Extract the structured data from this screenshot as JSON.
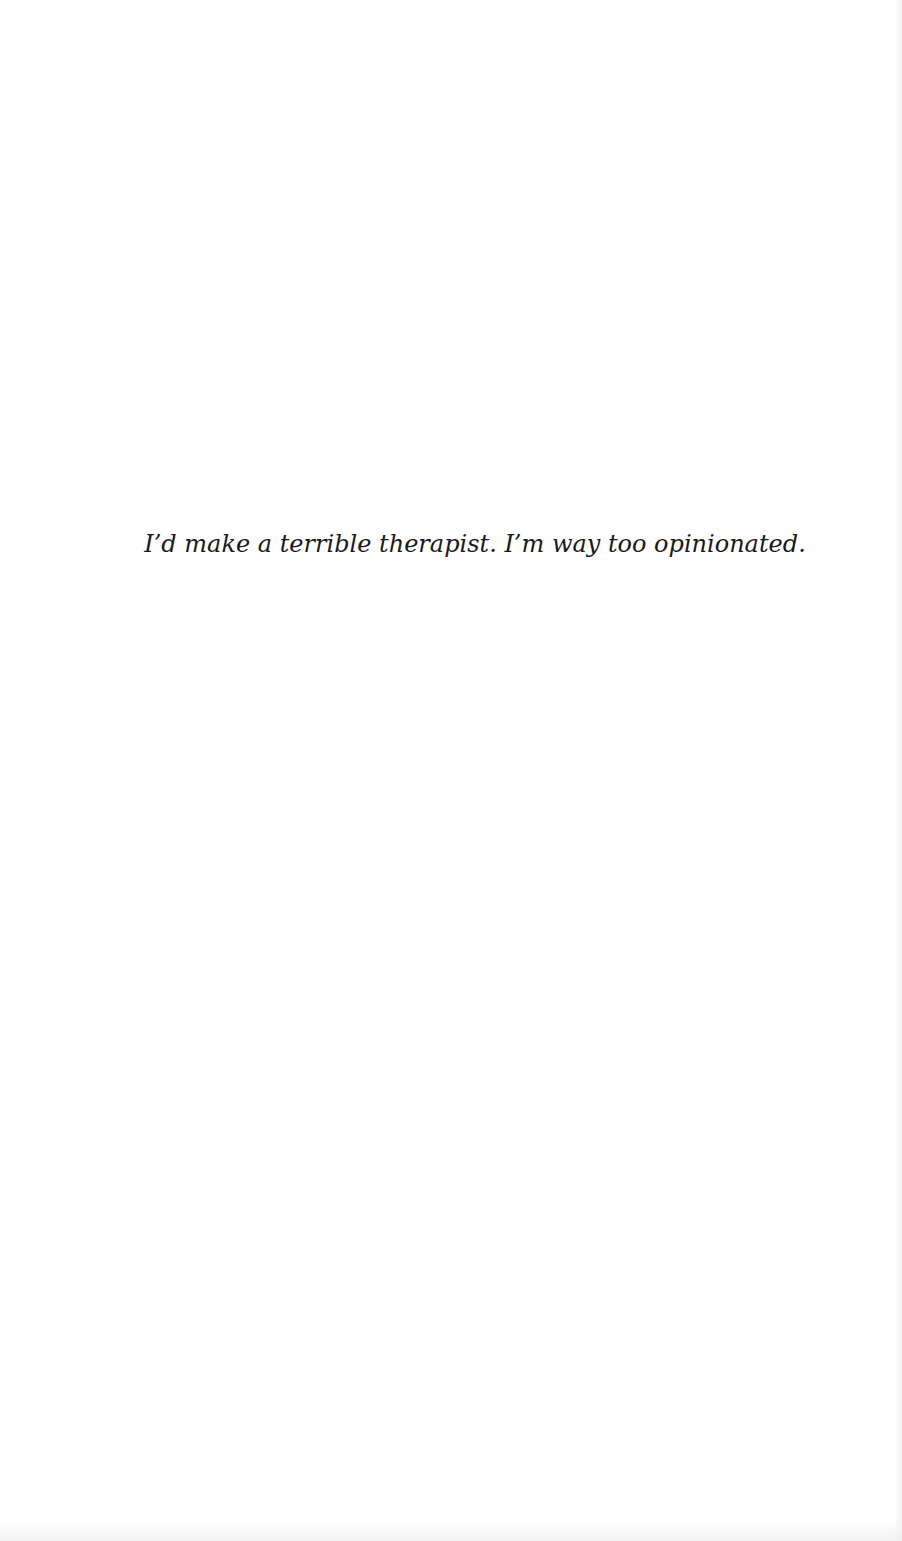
{
  "page": {
    "epigraph": "I’d make a terrible therapist. I’m way too opinionated."
  }
}
